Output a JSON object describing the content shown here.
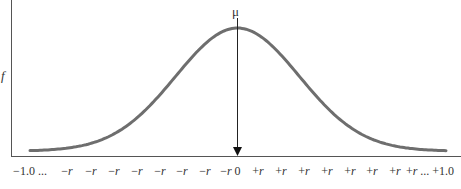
{
  "chart_data": {
    "type": "line",
    "title": "",
    "subtitle": "",
    "xlabel": "",
    "ylabel": "f",
    "annotation": {
      "label": "μ",
      "x": "0",
      "description": "vertical arrow from peak down to x-axis at 0"
    },
    "x_tick_labels": [
      "−1.0 ...",
      "−r",
      "−r",
      "−r",
      "−r",
      "−r",
      "−r",
      "−r",
      "−r",
      "0",
      "+r",
      "+r",
      "+r",
      "+r",
      "+r",
      "+r",
      "+r",
      "+r ... +1.0"
    ],
    "series": [
      {
        "name": "normal distribution density",
        "x": [
          -1.0,
          -0.75,
          -0.5,
          -0.35,
          -0.25,
          -0.15,
          -0.05,
          0,
          0.05,
          0.15,
          0.25,
          0.35,
          0.5,
          0.75,
          1.0
        ],
        "values": [
          0.02,
          0.06,
          0.2,
          0.38,
          0.55,
          0.78,
          0.97,
          1.0,
          0.97,
          0.78,
          0.55,
          0.38,
          0.2,
          0.06,
          0.02
        ]
      }
    ],
    "xlim": [
      -1.0,
      1.0
    ],
    "ylim": [
      0,
      1.05
    ],
    "grid": false,
    "legend": "none",
    "colors": {
      "curve": "#6e6e6e",
      "axes": "#555555",
      "arrow": "#222222"
    }
  }
}
